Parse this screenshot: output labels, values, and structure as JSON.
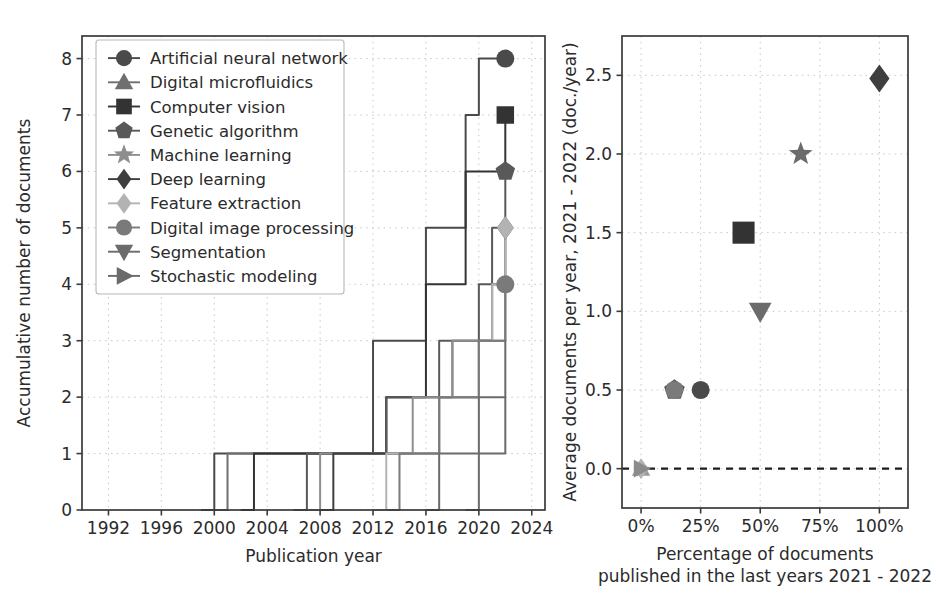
{
  "figure": {
    "background": "#ffffff",
    "width": 936,
    "height": 613
  },
  "legend": {
    "entries": [
      {
        "label": "Artificial neural network",
        "marker": "circle",
        "color": "#4a4a4a"
      },
      {
        "label": "Digital microfluidics",
        "marker": "triangle-up",
        "color": "#6f6f6f"
      },
      {
        "label": "Computer vision",
        "marker": "square",
        "color": "#333333"
      },
      {
        "label": "Genetic algorithm",
        "marker": "pentagon",
        "color": "#595959"
      },
      {
        "label": "Machine learning",
        "marker": "star",
        "color": "#8e8e8e"
      },
      {
        "label": "Deep learning",
        "marker": "diamond",
        "color": "#3f3f3f"
      },
      {
        "label": "Feature extraction",
        "marker": "diamond",
        "color": "#b3b3b3"
      },
      {
        "label": "Digital image processing",
        "marker": "circle",
        "color": "#7a7a7a"
      },
      {
        "label": "Segmentation",
        "marker": "triangle-down",
        "color": "#6b6b6b"
      },
      {
        "label": "Stochastic modeling",
        "marker": "triangle-right",
        "color": "#6b6b6b"
      }
    ]
  },
  "chart_data": [
    {
      "type": "line",
      "id": "accumulative-documents",
      "title": "",
      "xlabel": "Publication year",
      "ylabel": "Accumulative number of documents",
      "xlim": [
        1990,
        2025
      ],
      "ylim": [
        0,
        8.4
      ],
      "xticks": [
        1992,
        1996,
        2000,
        2004,
        2008,
        2012,
        2016,
        2020,
        2024
      ],
      "xticklabels": [
        "1992",
        "1996",
        "2000",
        "2004",
        "2008",
        "2012",
        "2016",
        "2020",
        "2024"
      ],
      "yticks": [
        0,
        1,
        2,
        3,
        4,
        5,
        6,
        7,
        8
      ],
      "yticklabels": [
        "0",
        "1",
        "2",
        "3",
        "4",
        "5",
        "6",
        "7",
        "8"
      ],
      "grid": true,
      "legend_position": "upper left",
      "drawstyle": "step-post",
      "series": [
        {
          "name": "Artificial neural network",
          "marker": "circle",
          "color": "#4a4a4a",
          "marker_at_last": true,
          "x": [
            1999,
            2000,
            2007,
            2012,
            2013,
            2016,
            2017,
            2019,
            2020,
            2022
          ],
          "y": [
            0,
            1,
            1,
            3,
            3,
            5,
            5,
            7,
            8,
            8
          ]
        },
        {
          "name": "Digital microfluidics",
          "marker": "triangle-up",
          "color": "#6f6f6f",
          "marker_at_last": false,
          "x": [
            2000,
            2001,
            2012,
            2013,
            2017,
            2018,
            2021,
            2022
          ],
          "y": [
            0,
            1,
            1,
            2,
            2,
            3,
            3,
            4
          ]
        },
        {
          "name": "Computer vision",
          "marker": "square",
          "color": "#333333",
          "marker_at_last": true,
          "x": [
            2002,
            2003,
            2012,
            2013,
            2015,
            2016,
            2018,
            2019,
            2021,
            2022
          ],
          "y": [
            0,
            1,
            1,
            2,
            2,
            4,
            4,
            6,
            6,
            7
          ]
        },
        {
          "name": "Genetic algorithm",
          "marker": "pentagon",
          "color": "#595959",
          "marker_at_last": true,
          "x": [
            2006,
            2007,
            2012,
            2013,
            2016,
            2017,
            2019,
            2020,
            2021,
            2022
          ],
          "y": [
            0,
            1,
            1,
            2,
            2,
            3,
            3,
            4,
            5,
            6
          ]
        },
        {
          "name": "Machine learning",
          "marker": "star",
          "color": "#8e8e8e",
          "marker_at_last": false,
          "x": [
            2007,
            2008,
            2014,
            2015,
            2017,
            2018,
            2020,
            2021,
            2022
          ],
          "y": [
            0,
            1,
            1,
            2,
            2,
            3,
            3,
            4,
            4
          ]
        },
        {
          "name": "Deep learning",
          "marker": "diamond",
          "color": "#3f3f3f",
          "marker_at_last": true,
          "x": [
            2008,
            2009,
            2016,
            2017,
            2019,
            2020,
            2021,
            2022
          ],
          "y": [
            0,
            1,
            1,
            2,
            2,
            3,
            4,
            5
          ]
        },
        {
          "name": "Feature extraction",
          "marker": "diamond",
          "color": "#b3b3b3",
          "marker_at_last": true,
          "x": [
            2012,
            2013,
            2016,
            2017,
            2019,
            2020,
            2021,
            2022
          ],
          "y": [
            0,
            1,
            1,
            2,
            2,
            3,
            4,
            5
          ]
        },
        {
          "name": "Digital image processing",
          "marker": "circle",
          "color": "#7a7a7a",
          "marker_at_last": true,
          "x": [
            2013,
            2014,
            2016,
            2017,
            2019,
            2020,
            2021,
            2022
          ],
          "y": [
            0,
            1,
            1,
            2,
            2,
            3,
            3,
            4
          ]
        },
        {
          "name": "Segmentation",
          "marker": "triangle-down",
          "color": "#6b6b6b",
          "marker_at_last": false,
          "x": [
            2016,
            2017,
            2019,
            2020,
            2021,
            2022
          ],
          "y": [
            0,
            1,
            1,
            2,
            2,
            3
          ]
        },
        {
          "name": "Stochastic modeling",
          "marker": "triangle-right",
          "color": "#6b6b6b",
          "marker_at_last": false,
          "x": [
            2019,
            2020,
            2021,
            2022
          ],
          "y": [
            0,
            1,
            1,
            2
          ]
        }
      ]
    },
    {
      "type": "scatter",
      "id": "average-documents-vs-percentage",
      "title": "",
      "xlabel_line1": "Percentage of documents",
      "xlabel_line2": "published in the last years 2021 - 2022",
      "ylabel": "Average documents per year, 2021 - 2022 (doc./year)",
      "xlim": [
        -8,
        112
      ],
      "ylim": [
        -0.25,
        2.75
      ],
      "xticks": [
        0,
        25,
        50,
        75,
        100
      ],
      "xticklabels": [
        "0%",
        "25%",
        "50%",
        "75%",
        "100%"
      ],
      "yticks": [
        0.0,
        0.5,
        1.0,
        1.5,
        2.0,
        2.5
      ],
      "yticklabels": [
        "0.0",
        "0.5",
        "1.0",
        "1.5",
        "2.0",
        "2.5"
      ],
      "grid": true,
      "hline_at": 0.0,
      "points": [
        {
          "name": "Artificial neural network",
          "marker": "circle",
          "color": "#4a4a4a",
          "x": 25,
          "y": 0.5,
          "size": 19
        },
        {
          "name": "Digital microfluidics",
          "marker": "triangle-up",
          "color": "#9a9a9a",
          "x": 0,
          "y": 0.0,
          "size": 17
        },
        {
          "name": "Computer vision",
          "marker": "square",
          "color": "#333333",
          "x": 43,
          "y": 1.5,
          "size": 24
        },
        {
          "name": "Genetic algorithm",
          "marker": "pentagon",
          "color": "#595959",
          "x": 14,
          "y": 0.5,
          "size": 20
        },
        {
          "name": "Machine learning",
          "marker": "star",
          "color": "#6b6b6b",
          "x": 67,
          "y": 2.0,
          "size": 20
        },
        {
          "name": "Deep learning",
          "marker": "diamond",
          "color": "#3f3f3f",
          "x": 100,
          "y": 2.48,
          "size": 23
        },
        {
          "name": "Feature extraction",
          "marker": "diamond",
          "color": "#b3b3b3",
          "x": 0,
          "y": 0.0,
          "size": 17
        },
        {
          "name": "Digital image processing",
          "marker": "circle",
          "color": "#7a7a7a",
          "x": 14,
          "y": 0.5,
          "size": 19
        },
        {
          "name": "Segmentation",
          "marker": "triangle-down",
          "color": "#6b6b6b",
          "x": 50,
          "y": 1.0,
          "size": 21
        },
        {
          "name": "Stochastic modeling",
          "marker": "triangle-right",
          "color": "#8b8b8b",
          "x": 0,
          "y": 0.0,
          "size": 17
        }
      ]
    }
  ]
}
